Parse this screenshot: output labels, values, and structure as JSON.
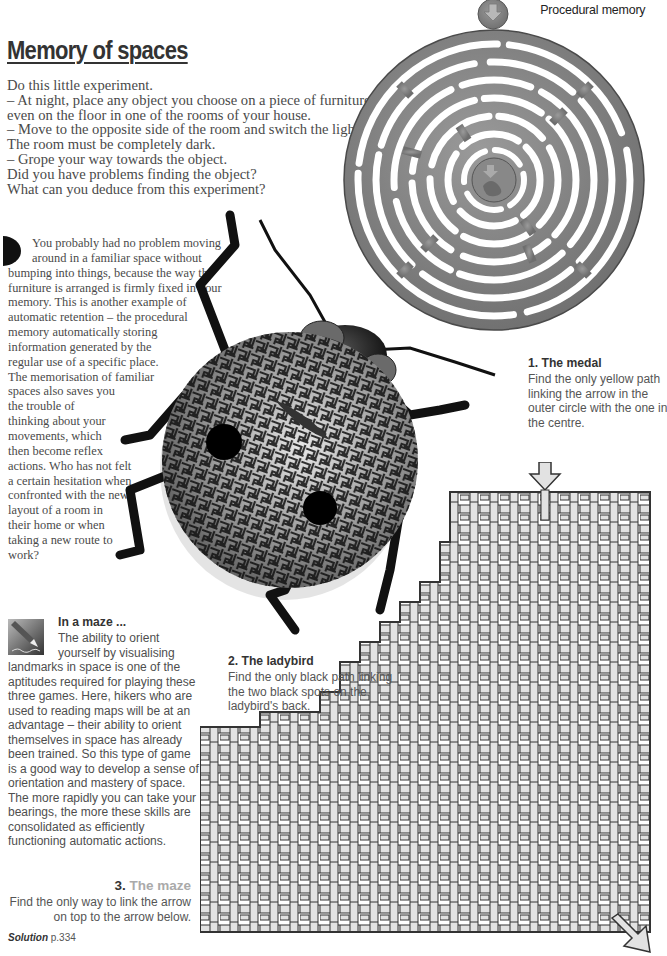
{
  "header": {
    "section_label": "Procedural memory",
    "title": "Memory of spaces"
  },
  "intro": {
    "lines": [
      "Do this little experiment.",
      "– At night, place any object you choose on a piece of furniture or",
      "even on the floor in one of the rooms of your house.",
      "– Move to the opposite side of the room and switch the light off.",
      "The room must be completely dark.",
      "– Grope your way towards the object.",
      "Did you have problems finding the object?",
      "What can you deduce from this experiment?"
    ]
  },
  "explanation": {
    "dropcap_icon": "half-circle-dropcap",
    "lines": [
      "You probably had no problem moving",
      "around in a familiar space without",
      "bumping into things, because the way the",
      "furniture is arranged is firmly fixed in your",
      "memory. This is another example of",
      "automatic retention – the procedural",
      "memory automatically storing",
      "information generated by the",
      "regular use of a specific place.",
      "The memorisation of familiar",
      "spaces also saves you",
      "the trouble of",
      "thinking about your",
      "movements, which",
      "then become reflex",
      "actions. Who has not felt",
      "a certain hesitation when",
      "confronted with the new",
      "layout of a room in",
      "their home or when",
      "taking a new route to",
      "work?"
    ]
  },
  "puzzles": {
    "medal": {
      "heading": "1. The medal",
      "lines": [
        "Find the only yellow path",
        "linking the arrow in the",
        "outer circle with the one in",
        "the centre."
      ]
    },
    "ladybird": {
      "heading": "2. The ladybird",
      "lines": [
        "Find the only black path linking",
        "the two black spots on the",
        "ladybird's back."
      ]
    },
    "maze": {
      "number": "3.",
      "heading": "The maze",
      "lines": [
        "Find the only way to link the arrow",
        "on top to the arrow below."
      ]
    }
  },
  "sidebar_box": {
    "icon": "pencil-drawing-icon",
    "title": "In a maze ...",
    "lines": [
      "The ability to orient",
      "yourself by visualising",
      "landmarks in space is one of the",
      "aptitudes required for playing these",
      "three games. Here, hikers who are",
      "used to reading maps will be at an",
      "advantage – their ability to orient",
      "themselves in space has already",
      "been trained. So this type of game",
      "is a good way to develop a sense of",
      "orientation and mastery of space.",
      "The more rapidly you can take your",
      "bearings, the more these skills are",
      "consolidated as efficiently",
      "functioning automatic actions."
    ]
  },
  "footer": {
    "solution_label": "Solution",
    "solution_page": "p.334"
  },
  "colors": {
    "title": "#333333",
    "body": "#4a4a4a",
    "maze_light": "#aaaaaa",
    "medal_metal": "#8a8a8a",
    "maze_bar": "#e2e2e2",
    "maze_outline": "#333333"
  }
}
